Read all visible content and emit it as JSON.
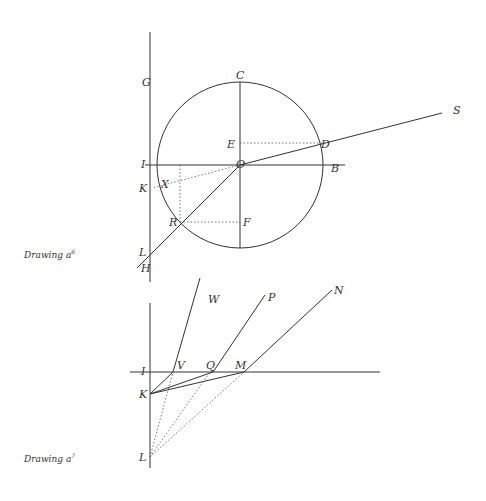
{
  "drawings": [
    {
      "caption": "Drawing a",
      "superscript": "6",
      "labels": {
        "G": "G",
        "C": "C",
        "S": "S",
        "E": "E",
        "D": "D",
        "I": "I",
        "O": "O",
        "B": "B",
        "K": "K",
        "X": "X",
        "R": "R",
        "F": "F",
        "L": "L",
        "H": "H"
      }
    },
    {
      "caption": "Drawing a",
      "superscript": "7",
      "labels": {
        "W": "W",
        "P": "P",
        "N": "N",
        "I": "I",
        "V": "V",
        "Q": "Q",
        "M": "M",
        "K": "K",
        "L": "L"
      }
    }
  ]
}
